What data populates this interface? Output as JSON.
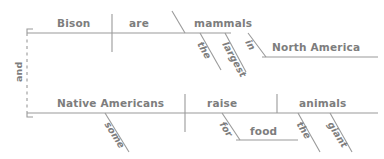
{
  "diagram": {
    "type": "reed-kellogg-sentence-diagram",
    "sentence": "Bison are the largest mammals in North America, and Native Americans raise some giant animals for food.",
    "stroke_color": "#9a9a9a",
    "text_color": "#7d7d7d",
    "conjunction": {
      "label": "and",
      "orientation": "vertical-rotated",
      "connector_style": "dashed"
    },
    "clauses": [
      {
        "id": "clause-1",
        "subject": "Bison",
        "verb": "are",
        "predicate_nominative": "mammals",
        "modifiers": [
          {
            "word": "the",
            "attaches_to": "mammals"
          },
          {
            "word": "largest",
            "attaches_to": "mammals"
          }
        ],
        "prepositional_phrase": {
          "preposition": "in",
          "object": "North America",
          "attaches_to": "mammals"
        }
      },
      {
        "id": "clause-2",
        "subject": "Native Americans",
        "verb": "raise",
        "direct_object": "animals",
        "modifiers": [
          {
            "word": "some",
            "attaches_to": "Native Americans"
          },
          {
            "word": "the",
            "attaches_to": "animals"
          },
          {
            "word": "giant",
            "attaches_to": "animals"
          }
        ],
        "prepositional_phrase": {
          "preposition": "for",
          "object": "food",
          "attaches_to": "raise"
        }
      }
    ],
    "labels": {
      "and": "and",
      "bison": "Bison",
      "are": "are",
      "mammals": "mammals",
      "the_1": "the",
      "largest": "largest",
      "in": "in",
      "north_america": "North America",
      "native_americans": "Native Americans",
      "some": "some",
      "raise": "raise",
      "for": "for",
      "food": "food",
      "animals": "animals",
      "the_2": "the",
      "giant": "giant"
    }
  }
}
